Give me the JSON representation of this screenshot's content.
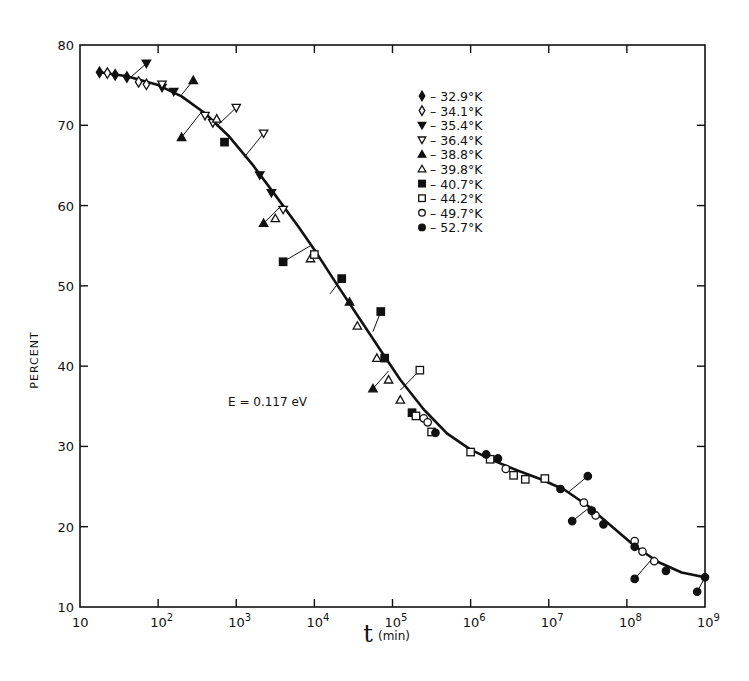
{
  "chart_data": {
    "type": "scatter",
    "title": "",
    "xlabel": "t",
    "xlabel_unit": "(min)",
    "ylabel": "PERCENT",
    "xscale": "log",
    "xlim": [
      10,
      1000000000
    ],
    "ylim": [
      10,
      80
    ],
    "grid": false,
    "legend_position": "upper right (inside)",
    "x_ticks": [
      {
        "value": 10,
        "label_base": "10",
        "label_exp": ""
      },
      {
        "value": 100,
        "label_base": "10",
        "label_exp": "2"
      },
      {
        "value": 1000,
        "label_base": "10",
        "label_exp": "3"
      },
      {
        "value": 10000,
        "label_base": "10",
        "label_exp": "4"
      },
      {
        "value": 100000,
        "label_base": "10",
        "label_exp": "5"
      },
      {
        "value": 1000000,
        "label_base": "10",
        "label_exp": "6"
      },
      {
        "value": 10000000,
        "label_base": "10",
        "label_exp": "7"
      },
      {
        "value": 100000000,
        "label_base": "10",
        "label_exp": "8"
      },
      {
        "value": 1000000000,
        "label_base": "10",
        "label_exp": "9"
      }
    ],
    "y_ticks": [
      10,
      20,
      30,
      40,
      50,
      60,
      70,
      80
    ],
    "annotation": "E = 0.117 eV",
    "fit_curve": {
      "name": "master curve",
      "log10_t": [
        1.25,
        1.6,
        2.0,
        2.3,
        2.6,
        2.9,
        3.2,
        3.5,
        3.8,
        4.0,
        4.3,
        4.6,
        4.9,
        5.1,
        5.4,
        5.7,
        6.0,
        6.3,
        6.6,
        6.9,
        7.2,
        7.5,
        7.8,
        8.1,
        8.4,
        8.7,
        8.95
      ],
      "percent": [
        76.6,
        76.1,
        75.0,
        73.6,
        71.5,
        68.7,
        65.2,
        61.3,
        57.3,
        54.5,
        50.0,
        45.6,
        41.2,
        38.3,
        34.6,
        31.6,
        29.6,
        28.2,
        27.0,
        25.9,
        24.6,
        22.6,
        20.1,
        17.6,
        15.6,
        14.3,
        13.8
      ]
    },
    "series": [
      {
        "name": "32.9°K",
        "marker": "filled-diamond",
        "points": [
          [
            1.25,
            76.6
          ],
          [
            1.45,
            76.3
          ],
          [
            1.6,
            76.0
          ]
        ]
      },
      {
        "name": "34.1°K",
        "marker": "open-diamond",
        "points": [
          [
            1.35,
            76.5
          ],
          [
            1.75,
            75.4
          ],
          [
            1.85,
            75.1
          ]
        ]
      },
      {
        "name": "35.4°K",
        "marker": "filled-triangle-down",
        "points": [
          [
            1.85,
            77.7
          ],
          [
            2.05,
            74.7
          ],
          [
            2.2,
            74.2
          ],
          [
            3.3,
            63.8
          ],
          [
            3.45,
            61.6
          ]
        ]
      },
      {
        "name": "36.4°K",
        "marker": "open-triangle-down",
        "points": [
          [
            2.05,
            75.1
          ],
          [
            2.6,
            71.2
          ],
          [
            2.7,
            70.3
          ],
          [
            3.0,
            72.2
          ],
          [
            3.35,
            69.0
          ],
          [
            3.6,
            59.5
          ]
        ]
      },
      {
        "name": "38.8°K",
        "marker": "filled-triangle-up",
        "points": [
          [
            2.45,
            75.6
          ],
          [
            2.3,
            68.5
          ],
          [
            3.35,
            57.8
          ],
          [
            4.45,
            48.0
          ],
          [
            4.75,
            37.2
          ]
        ]
      },
      {
        "name": "39.8°K",
        "marker": "open-triangle-up",
        "points": [
          [
            2.75,
            70.8
          ],
          [
            3.5,
            58.4
          ],
          [
            3.95,
            53.4
          ],
          [
            4.55,
            45.0
          ],
          [
            4.8,
            41.0
          ],
          [
            4.95,
            38.3
          ],
          [
            5.1,
            35.8
          ]
        ]
      },
      {
        "name": "40.7°K",
        "marker": "filled-square",
        "points": [
          [
            2.85,
            67.9
          ],
          [
            3.6,
            53.0
          ],
          [
            4.35,
            50.9
          ],
          [
            4.85,
            46.8
          ],
          [
            4.9,
            41.0
          ],
          [
            5.25,
            34.2
          ]
        ]
      },
      {
        "name": "44.2°K",
        "marker": "open-square",
        "points": [
          [
            4.0,
            53.9
          ],
          [
            5.35,
            39.5
          ],
          [
            5.3,
            33.8
          ],
          [
            5.5,
            31.8
          ],
          [
            6.0,
            29.3
          ],
          [
            6.25,
            28.4
          ],
          [
            6.55,
            26.4
          ],
          [
            6.7,
            25.9
          ],
          [
            6.95,
            26.0
          ]
        ]
      },
      {
        "name": "49.7°K",
        "marker": "open-circle",
        "points": [
          [
            5.4,
            33.5
          ],
          [
            5.45,
            33.0
          ],
          [
            6.45,
            27.2
          ],
          [
            7.45,
            23.0
          ],
          [
            7.6,
            21.4
          ],
          [
            8.1,
            18.2
          ],
          [
            8.2,
            16.9
          ],
          [
            8.35,
            15.7
          ]
        ]
      },
      {
        "name": "52.7°K",
        "marker": "filled-circle",
        "points": [
          [
            5.55,
            31.7
          ],
          [
            6.2,
            29.0
          ],
          [
            6.35,
            28.5
          ],
          [
            7.15,
            24.7
          ],
          [
            7.5,
            26.3
          ],
          [
            7.3,
            20.7
          ],
          [
            7.55,
            22.0
          ],
          [
            7.7,
            20.3
          ],
          [
            8.1,
            17.5
          ],
          [
            8.1,
            13.5
          ],
          [
            8.5,
            14.5
          ],
          [
            8.9,
            11.9
          ],
          [
            9.0,
            13.7
          ]
        ]
      }
    ],
    "offset_links": [
      [
        [
          1.85,
          77.7
        ],
        [
          1.65,
          76.0
        ]
      ],
      [
        [
          2.45,
          75.6
        ],
        [
          2.3,
          73.8
        ]
      ],
      [
        [
          2.3,
          68.5
        ],
        [
          2.55,
          71.6
        ]
      ],
      [
        [
          3.0,
          72.2
        ],
        [
          2.75,
          69.9
        ]
      ],
      [
        [
          3.35,
          69.0
        ],
        [
          3.1,
          66.0
        ]
      ],
      [
        [
          3.35,
          57.8
        ],
        [
          3.6,
          60.2
        ]
      ],
      [
        [
          3.6,
          53.0
        ],
        [
          3.95,
          55.0
        ]
      ],
      [
        [
          4.35,
          50.9
        ],
        [
          4.2,
          49.0
        ]
      ],
      [
        [
          4.85,
          46.8
        ],
        [
          4.75,
          44.3
        ]
      ],
      [
        [
          4.75,
          37.2
        ],
        [
          4.95,
          39.4
        ]
      ],
      [
        [
          5.35,
          39.5
        ],
        [
          5.1,
          37.0
        ]
      ],
      [
        [
          7.5,
          26.3
        ],
        [
          7.25,
          24.3
        ]
      ],
      [
        [
          7.3,
          20.7
        ],
        [
          7.55,
          22.6
        ]
      ],
      [
        [
          8.1,
          13.5
        ],
        [
          8.35,
          16.3
        ]
      ],
      [
        [
          8.9,
          11.9
        ],
        [
          9.0,
          13.7
        ]
      ]
    ]
  },
  "legend": {
    "items": [
      {
        "marker": "filled-diamond",
        "label": "– 32.9°K"
      },
      {
        "marker": "open-diamond",
        "label": "– 34.1°K"
      },
      {
        "marker": "filled-triangle-down",
        "label": "– 35.4°K"
      },
      {
        "marker": "open-triangle-down",
        "label": "– 36.4°K"
      },
      {
        "marker": "filled-triangle-up",
        "label": "– 38.8°K"
      },
      {
        "marker": "open-triangle-up",
        "label": "– 39.8°K"
      },
      {
        "marker": "filled-square",
        "label": "– 40.7°K"
      },
      {
        "marker": "open-square",
        "label": "– 44.2°K"
      },
      {
        "marker": "open-circle",
        "label": "– 49.7°K"
      },
      {
        "marker": "filled-circle",
        "label": "– 52.7°K"
      }
    ]
  },
  "labels": {
    "y_axis": "PERCENT",
    "x_axis_symbol": "t",
    "x_axis_unit": "(min)",
    "annotation": "E = 0.117 eV"
  },
  "colors": {
    "ink": "#111111",
    "background": "#ffffff"
  }
}
